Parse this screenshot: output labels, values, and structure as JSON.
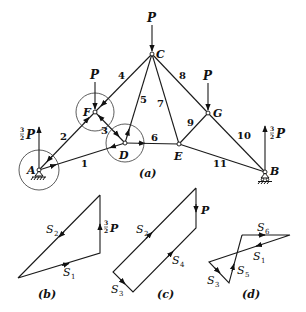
{
  "figure": {
    "truss": {
      "caption": "(a)",
      "joints": {
        "A": {
          "label": "A",
          "x": 39,
          "y": 170
        },
        "F": {
          "label": "F",
          "x": 95,
          "y": 112
        },
        "C": {
          "label": "C",
          "x": 152,
          "y": 54
        },
        "D": {
          "label": "D",
          "x": 125,
          "y": 143
        },
        "E": {
          "label": "E",
          "x": 179,
          "y": 144
        },
        "G": {
          "label": "G",
          "x": 208,
          "y": 113
        },
        "B": {
          "label": "B",
          "x": 265,
          "y": 172
        }
      },
      "members": [
        {
          "num": "1",
          "from": "A",
          "to": "D"
        },
        {
          "num": "2",
          "from": "A",
          "to": "F"
        },
        {
          "num": "3",
          "from": "F",
          "to": "D"
        },
        {
          "num": "4",
          "from": "F",
          "to": "C"
        },
        {
          "num": "5",
          "from": "D",
          "to": "C"
        },
        {
          "num": "6",
          "from": "D",
          "to": "E"
        },
        {
          "num": "7",
          "from": "E",
          "to": "C"
        },
        {
          "num": "8",
          "from": "C",
          "to": "G"
        },
        {
          "num": "9",
          "from": "E",
          "to": "G"
        },
        {
          "num": "10",
          "from": "G",
          "to": "B"
        },
        {
          "num": "11",
          "from": "E",
          "to": "B"
        }
      ],
      "loads": [
        {
          "label": "P",
          "at": "C",
          "direction": "down"
        },
        {
          "label": "P",
          "at": "F",
          "direction": "down"
        },
        {
          "label": "P",
          "at": "G",
          "direction": "down"
        }
      ],
      "reactions": [
        {
          "label": "3/2 P",
          "at": "A",
          "direction": "up"
        },
        {
          "label": "3/2 P",
          "at": "B",
          "direction": "up"
        }
      ]
    },
    "polygons": [
      {
        "caption": "(b)",
        "labels": [
          "S2",
          "S1",
          "3/2 P"
        ]
      },
      {
        "caption": "(c)",
        "labels": [
          "S2",
          "S4",
          "S3",
          "P"
        ]
      },
      {
        "caption": "(d)",
        "labels": [
          "S6",
          "S1",
          "S5",
          "S3"
        ]
      }
    ],
    "text": {
      "P": "P",
      "frac_num": "3",
      "frac_den": "2",
      "S": "S",
      "cap_a": "(a)",
      "cap_b": "(b)",
      "cap_c": "(c)",
      "cap_d": "(d)",
      "jA": "A",
      "jB": "B",
      "jC": "C",
      "jD": "D",
      "jE": "E",
      "jF": "F",
      "jG": "G",
      "m1": "1",
      "m2": "2",
      "m3": "3",
      "m4": "4",
      "m5": "5",
      "m6": "6",
      "m7": "7",
      "m8": "8",
      "m9": "9",
      "m10": "10",
      "m11": "11",
      "s1": "1",
      "s2": "2",
      "s3": "3",
      "s4": "4",
      "s5": "5",
      "s6": "6"
    }
  }
}
